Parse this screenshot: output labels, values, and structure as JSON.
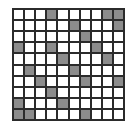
{
  "grid": {
    "rows": 10,
    "cols": 10,
    "colors": {
      "filled": "#8c8c8c",
      "empty": "#ffffff",
      "line": "#2b2b2b"
    },
    "cells": [
      [
        0,
        0,
        0,
        1,
        0,
        0,
        0,
        0,
        1,
        1
      ],
      [
        0,
        0,
        0,
        0,
        0,
        1,
        0,
        0,
        0,
        1
      ],
      [
        0,
        0,
        0,
        0,
        0,
        0,
        1,
        0,
        0,
        0
      ],
      [
        1,
        0,
        0,
        1,
        0,
        0,
        0,
        1,
        0,
        0
      ],
      [
        0,
        0,
        0,
        0,
        1,
        0,
        0,
        0,
        1,
        0
      ],
      [
        0,
        1,
        0,
        0,
        0,
        1,
        0,
        0,
        0,
        0
      ],
      [
        0,
        0,
        1,
        0,
        0,
        0,
        1,
        0,
        0,
        1
      ],
      [
        0,
        0,
        0,
        1,
        0,
        0,
        0,
        0,
        0,
        0
      ],
      [
        1,
        0,
        0,
        0,
        1,
        0,
        0,
        0,
        0,
        0
      ],
      [
        1,
        1,
        0,
        0,
        0,
        0,
        1,
        0,
        0,
        0
      ]
    ]
  }
}
